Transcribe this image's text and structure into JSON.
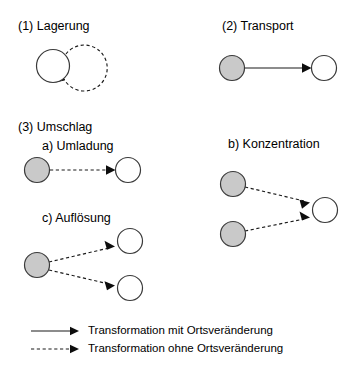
{
  "diagram": {
    "title_items": [
      {
        "id": "lagerung",
        "text": "(1) Lagerung",
        "x": 18,
        "y": 19
      },
      {
        "id": "transport",
        "text": "(2) Transport",
        "x": 222,
        "y": 19
      },
      {
        "id": "umschlag",
        "text": "(3) Umschlag",
        "x": 18,
        "y": 120
      },
      {
        "id": "umladung",
        "text": "a) Umladung",
        "x": 42,
        "y": 139
      },
      {
        "id": "konzentration",
        "text": "b) Konzentration",
        "x": 228,
        "y": 137
      },
      {
        "id": "aufloesung",
        "text": "c) Auflösung",
        "x": 42,
        "y": 211
      }
    ],
    "legend": {
      "entries": [
        {
          "id": "solid",
          "style": "solid",
          "text": "Transformation mit Ortsveränderung"
        },
        {
          "id": "dashed",
          "style": "dashed",
          "text": "Transformation ohne Ortsveränderung"
        }
      ]
    },
    "colors": {
      "node_gray": "#c9c9c9",
      "node_white": "#ffffff",
      "node_outline": "#3a3a3a",
      "edge": "#1a1a1a",
      "background": "#ffffff",
      "text": "#000000"
    },
    "nodes": [
      {
        "id": "n1-source",
        "group": "lagerung",
        "fill": "gray_none",
        "type": "white",
        "cx": 53,
        "cy": 66,
        "r": 16.5
      },
      {
        "id": "n2-origin",
        "group": "transport",
        "type": "gray",
        "cx": 232,
        "cy": 68,
        "r": 12.5
      },
      {
        "id": "n2-dest",
        "group": "transport",
        "type": "white",
        "cx": 324,
        "cy": 68,
        "r": 12.5
      },
      {
        "id": "n3a-origin",
        "group": "umladung",
        "type": "gray",
        "cx": 37,
        "cy": 170,
        "r": 12.5
      },
      {
        "id": "n3a-dest",
        "group": "umladung",
        "type": "white",
        "cx": 128,
        "cy": 170,
        "r": 12.5
      },
      {
        "id": "n3b-origin-1",
        "group": "konzentration",
        "type": "gray",
        "cx": 233,
        "cy": 184,
        "r": 12.5
      },
      {
        "id": "n3b-origin-2",
        "group": "konzentration",
        "type": "gray",
        "cx": 233,
        "cy": 234,
        "r": 12.5
      },
      {
        "id": "n3b-dest",
        "group": "konzentration",
        "type": "white",
        "cx": 325,
        "cy": 210,
        "r": 12.5
      },
      {
        "id": "n3c-origin",
        "group": "aufloesung",
        "type": "gray",
        "cx": 37,
        "cy": 265,
        "r": 12.5
      },
      {
        "id": "n3c-dest-1",
        "group": "aufloesung",
        "type": "white",
        "cx": 130,
        "cy": 241,
        "r": 12.5
      },
      {
        "id": "n3c-dest-2",
        "group": "aufloesung",
        "type": "white",
        "cx": 130,
        "cy": 288,
        "r": 12.5
      }
    ],
    "edges": [
      {
        "id": "e-lagerung-selfloop",
        "group": "lagerung",
        "style": "dashed",
        "kind": "self-loop"
      },
      {
        "id": "e-transport",
        "group": "transport",
        "style": "solid",
        "kind": "straight"
      },
      {
        "id": "e-umladung",
        "group": "umladung",
        "style": "dashed",
        "kind": "straight"
      },
      {
        "id": "e-konz-1",
        "group": "konzentration",
        "style": "dashed",
        "kind": "straight"
      },
      {
        "id": "e-konz-2",
        "group": "konzentration",
        "style": "dashed",
        "kind": "straight"
      },
      {
        "id": "e-aufl-1",
        "group": "aufloesung",
        "style": "dashed",
        "kind": "straight"
      },
      {
        "id": "e-aufl-2",
        "group": "aufloesung",
        "style": "dashed",
        "kind": "straight"
      }
    ]
  }
}
